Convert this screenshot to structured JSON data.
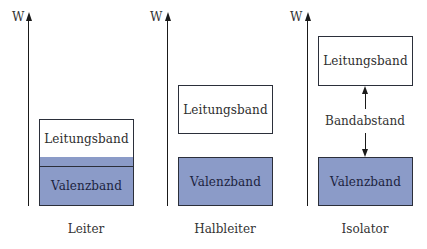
{
  "axis_label": "W",
  "colors": {
    "valence_fill": "#8b9bc8",
    "conduction_fill": "#ffffff",
    "outline": "#2b2f3a"
  },
  "panels": [
    {
      "caption": "Leiter",
      "conduction_band": "Leitungsband",
      "valence_band": "Valenzband",
      "overlap": true
    },
    {
      "caption": "Halbleiter",
      "conduction_band": "Leitungsband",
      "valence_band": "Valenzband"
    },
    {
      "caption": "Isolator",
      "conduction_band": "Leitungsband",
      "valence_band": "Valenzband",
      "gap_label": "Bandabstand"
    }
  ]
}
